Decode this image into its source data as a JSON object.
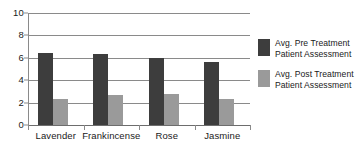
{
  "chart_data": {
    "type": "bar",
    "title": "",
    "subtitle": "",
    "xlabel": "",
    "ylabel": "",
    "categories": [
      "Lavender",
      "Frankincense",
      "Rose",
      "Jasmine"
    ],
    "series": [
      {
        "name": "Avg. Pre Treatment Patient Assessment",
        "color": "#3d3d3d",
        "values": [
          6.4,
          6.3,
          6.0,
          5.6
        ]
      },
      {
        "name": "Avg. Post Treatment Patient Assessment",
        "color": "#9a9a9a",
        "values": [
          2.3,
          2.7,
          2.8,
          2.3
        ]
      }
    ],
    "ylim": [
      0,
      10
    ],
    "ytick_values": [
      10,
      8,
      6,
      4,
      2,
      0
    ],
    "ytick_labels": [
      "10",
      "8",
      "6",
      "4",
      "2",
      "0"
    ],
    "grid": true,
    "grid_axis": "y",
    "legend_position": "right"
  },
  "legend": {
    "entries": [
      {
        "line1": "Avg. Pre Treatment",
        "line2": "Patient Assessment",
        "swatch": "dark-square-swatch"
      },
      {
        "line1": "Avg. Post Treatment",
        "line2": "Patient Assessment",
        "swatch": "light-square-swatch"
      }
    ]
  },
  "axes": {
    "y_tick_labels": [
      "10",
      "8",
      "6",
      "4",
      "2",
      "0"
    ],
    "x_tick_labels": [
      "Lavender",
      "Frankincense",
      "Rose",
      "Jasmine"
    ]
  }
}
